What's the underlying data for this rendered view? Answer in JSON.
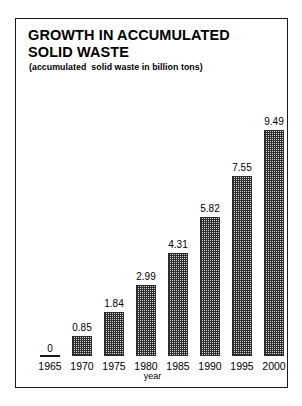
{
  "chart": {
    "title": "GROWTH IN ACCUMULATED SOLID WASTE",
    "subtitle": "(accumulated  solid waste in billion tons)",
    "axis_title": "year",
    "zero_label": "0"
  },
  "chart_data": {
    "type": "bar",
    "title": "GROWTH IN ACCUMULATED SOLID WASTE",
    "subtitle": "(accumulated  solid waste in billion tons)",
    "xlabel": "year",
    "ylabel": "accumulated solid waste in billion tons",
    "categories": [
      "1965",
      "1970",
      "1975",
      "1980",
      "1985",
      "1990",
      "1995",
      "2000"
    ],
    "values": [
      0,
      0.85,
      1.84,
      2.99,
      4.31,
      5.82,
      7.55,
      9.49
    ],
    "value_labels": [
      "0",
      "0.85",
      "1.84",
      "2.99",
      "4.31",
      "5.82",
      "7.55",
      "9.49"
    ],
    "ylim": [
      0,
      9.49
    ],
    "grid": false,
    "legend": false,
    "bar_fill": "#d8d8d8",
    "bar_outline": "#2b2b2b",
    "frame_color": "#1a1a1a",
    "background": "#ffffff"
  }
}
